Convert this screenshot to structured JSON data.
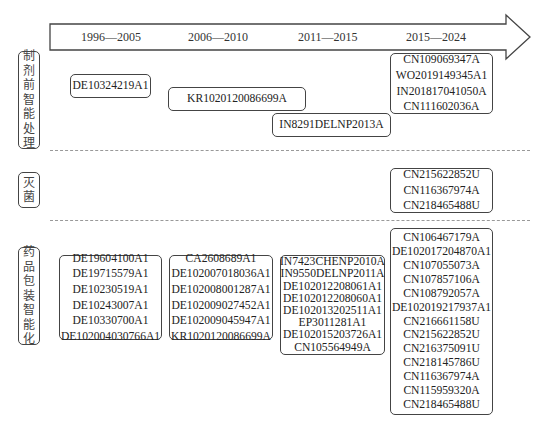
{
  "timeline": {
    "periods": [
      "1996—2005",
      "2006—2010",
      "2011—2015",
      "2015—2024"
    ]
  },
  "categories": [
    {
      "label": "制剂前智能处理",
      "chars": [
        "制",
        "剂",
        "前",
        "智",
        "能",
        "处",
        "理"
      ],
      "groups": [
        {
          "period": "1996—2005",
          "patents": [
            "DE10324219A1"
          ]
        },
        {
          "period": "2006—2010",
          "patents": [
            "KR1020120086699A"
          ]
        },
        {
          "period": "2011—2015",
          "patents": [
            "IN8291DELNP2013A"
          ]
        },
        {
          "period": "2015—2024",
          "patents": [
            "CN109069347A",
            "WO2019149345A1",
            "IN201817041050A",
            "CN111602036A"
          ]
        }
      ]
    },
    {
      "label": "灭菌",
      "chars": [
        "灭",
        "菌"
      ],
      "groups": [
        {
          "period": "2015—2024",
          "patents": [
            "CN215622852U",
            "CN116367974A",
            "CN218465488U"
          ]
        }
      ]
    },
    {
      "label": "药品包装智能化",
      "chars": [
        "药",
        "品",
        "包",
        "装",
        "智",
        "能",
        "化"
      ],
      "groups": [
        {
          "period": "1996—2005",
          "patents": [
            "DE19604100A1",
            "DE19715579A1",
            "DE10230519A1",
            "DE10243007A1",
            "DE10330700A1",
            "DE102004030766A1"
          ]
        },
        {
          "period": "2006—2010",
          "patents": [
            "CA2608689A1",
            "DE102007018036A1",
            "DE102008001287A1",
            "DE102009027452A1",
            "DE102009045947A1",
            "KR1020120086699A"
          ]
        },
        {
          "period": "2011—2015",
          "patents": [
            "IN7423CHENP2010A",
            "IN9550DELNP2011A",
            "DE102012208061A1",
            "DE102012208060A1",
            "DE102013202511A1",
            "EP3011281A1",
            "DE102015203726A1",
            "CN105564949A"
          ]
        },
        {
          "period": "2015—2024",
          "patents": [
            "CN106467179A",
            "DE102017204870A1",
            "CN107055073A",
            "CN107857106A",
            "CN108792057A",
            "DE102019217937A1",
            "CN216661158U",
            "CN215622852U",
            "CN216375091U",
            "CN218145786U",
            "CN116367974A",
            "CN115959320A",
            "CN218465488U"
          ]
        }
      ]
    }
  ],
  "colors": {
    "stroke": "#444444",
    "dash": "#999999",
    "text": "#222222"
  }
}
